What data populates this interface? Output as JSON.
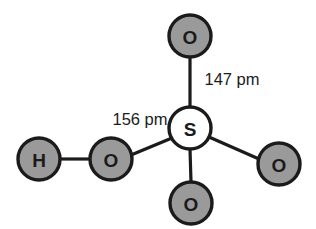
{
  "figure": {
    "background_color": "#ffffff",
    "line_color": "#1b1b1b",
    "shaded_atom_fill": "#9a9a9a",
    "center_atom_fill": "#ffffff"
  },
  "atoms": [
    {
      "id": "o-top",
      "symbol": "O",
      "element_name": "oxygen",
      "fill_style": "shaded",
      "cx": 190,
      "cy": 36,
      "r": 21
    },
    {
      "id": "s-center",
      "symbol": "S",
      "element_name": "sulfur",
      "fill_style": "light",
      "cx": 190,
      "cy": 128,
      "r": 21
    },
    {
      "id": "o-bottom",
      "symbol": "O",
      "element_name": "oxygen",
      "fill_style": "shaded",
      "cx": 191,
      "cy": 203,
      "r": 21
    },
    {
      "id": "o-right",
      "symbol": "O",
      "element_name": "oxygen",
      "fill_style": "shaded",
      "cx": 279,
      "cy": 164,
      "r": 21
    },
    {
      "id": "o-left",
      "symbol": "O",
      "element_name": "oxygen",
      "fill_style": "shaded",
      "cx": 111,
      "cy": 159,
      "r": 21
    },
    {
      "id": "h-left",
      "symbol": "H",
      "element_name": "hydrogen",
      "fill_style": "shaded",
      "cx": 39,
      "cy": 159,
      "r": 21
    }
  ],
  "bonds": [
    {
      "id": "bond-s-o-top",
      "from": "s-center",
      "to": "o-top",
      "x1": 190,
      "y1": 107,
      "x2": 190,
      "y2": 57,
      "label_ref": "label-147"
    },
    {
      "id": "bond-s-o-bottom",
      "from": "s-center",
      "to": "o-bottom",
      "x1": 190,
      "y1": 149,
      "x2": 191,
      "y2": 182,
      "label_ref": null
    },
    {
      "id": "bond-s-o-right",
      "from": "s-center",
      "to": "o-right",
      "x1": 209,
      "y1": 137,
      "x2": 259,
      "y2": 159,
      "label_ref": null
    },
    {
      "id": "bond-s-o-left",
      "from": "s-center",
      "to": "o-left",
      "x1": 172,
      "y1": 138,
      "x2": 131,
      "y2": 155,
      "label_ref": "label-156"
    },
    {
      "id": "bond-o-h",
      "from": "o-left",
      "to": "h-left",
      "x1": 90,
      "y1": 159,
      "x2": 60,
      "y2": 159,
      "label_ref": null
    }
  ],
  "labels": [
    {
      "id": "label-147",
      "text": "147 pm",
      "value": 147,
      "unit": "pm",
      "x": 232,
      "y": 79
    },
    {
      "id": "label-156",
      "text": "156 pm",
      "value": 156,
      "unit": "pm",
      "x": 140,
      "y": 119
    }
  ]
}
